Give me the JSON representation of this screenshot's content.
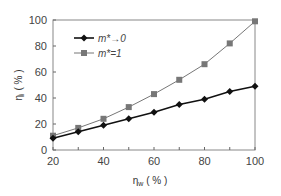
{
  "chart_data": {
    "type": "line",
    "title": "",
    "xlabel": "η_w ( % )",
    "ylabel": "η_i ( % )",
    "x": [
      20,
      30,
      40,
      50,
      60,
      70,
      80,
      90,
      100
    ],
    "xlim": [
      20,
      100
    ],
    "ylim": [
      0,
      100
    ],
    "xticks": [
      20,
      40,
      60,
      80,
      100
    ],
    "yticks": [
      0,
      20,
      40,
      60,
      80,
      100
    ],
    "grid": false,
    "legend_position": "upper left",
    "series": [
      {
        "name": "m*→0",
        "marker": "diamond",
        "color": "#111111",
        "values": [
          9,
          14,
          19,
          24,
          29,
          35,
          39,
          45,
          49
        ]
      },
      {
        "name": "m*=1",
        "marker": "square",
        "color": "#777777",
        "values": [
          11,
          17,
          24,
          33,
          43,
          54,
          66,
          82,
          99
        ]
      }
    ]
  },
  "axes": {
    "x_label_main": "η",
    "x_label_sub": "w",
    "x_label_unit": " ( % )",
    "y_label_main": "η",
    "y_label_sub": "i",
    "y_label_unit": " ( % )"
  },
  "legend": {
    "items": [
      {
        "label": "m*→0"
      },
      {
        "label": "m*=1"
      }
    ]
  }
}
